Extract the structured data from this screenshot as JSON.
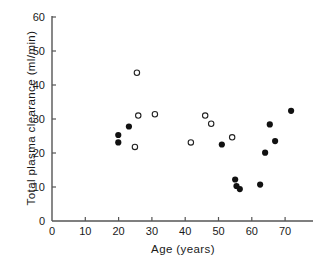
{
  "chart_data": {
    "type": "scatter",
    "title": "",
    "xlabel": "Age (years)",
    "ylabel": "Total plasma clearance (ml/min)",
    "xlim": [
      0,
      78
    ],
    "ylim": [
      0,
      60
    ],
    "xticks": [
      0,
      10,
      20,
      30,
      40,
      50,
      60,
      70
    ],
    "yticks": [
      0,
      10,
      20,
      30,
      40,
      50,
      60
    ],
    "xtick_labels": [
      "0",
      "10",
      "20",
      "30",
      "40",
      "50",
      "60",
      "70"
    ],
    "ytick_labels": [
      "0",
      "10",
      "20",
      "30",
      "40",
      "50",
      "60"
    ],
    "grid": false,
    "legend": null,
    "series": [
      {
        "name": "open-circles",
        "marker": "open-circle",
        "color": "#222222",
        "points": [
          {
            "x": 25.5,
            "y": 43.6
          },
          {
            "x": 25.9,
            "y": 31.0
          },
          {
            "x": 30.9,
            "y": 31.4
          },
          {
            "x": 24.9,
            "y": 21.8
          },
          {
            "x": 41.7,
            "y": 23.1
          },
          {
            "x": 46.0,
            "y": 31.0
          },
          {
            "x": 47.8,
            "y": 28.6
          },
          {
            "x": 54.1,
            "y": 24.6
          }
        ]
      },
      {
        "name": "filled-circles",
        "marker": "filled-circle",
        "color": "#111111",
        "points": [
          {
            "x": 19.9,
            "y": 25.3
          },
          {
            "x": 19.9,
            "y": 23.1
          },
          {
            "x": 23.1,
            "y": 27.8
          },
          {
            "x": 51.0,
            "y": 22.5
          },
          {
            "x": 55.0,
            "y": 12.2
          },
          {
            "x": 55.4,
            "y": 10.3
          },
          {
            "x": 56.4,
            "y": 9.4
          },
          {
            "x": 62.5,
            "y": 10.7
          },
          {
            "x": 64.0,
            "y": 20.1
          },
          {
            "x": 65.4,
            "y": 28.4
          },
          {
            "x": 67.0,
            "y": 23.5
          },
          {
            "x": 71.8,
            "y": 32.4
          }
        ]
      }
    ]
  },
  "axes": {
    "geometry": {
      "x_origin_px": 52,
      "y_origin_px": 221,
      "px_per_x_unit": 3.33,
      "px_per_y_unit": 3.4,
      "x_axis_end_px": 313,
      "y_axis_top_px": 16
    },
    "line_color": "#555555"
  }
}
